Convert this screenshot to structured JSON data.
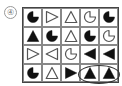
{
  "label": "④",
  "colors": {
    "fill": "#111111",
    "outline": "#555555",
    "grid": "#888888"
  },
  "grid": {
    "rows": [
      [
        {
          "shape": "pacman",
          "fill": "black"
        },
        {
          "shape": "triangle-right",
          "fill": "white"
        },
        {
          "shape": "triangle-up",
          "fill": "white"
        },
        {
          "shape": "pacman",
          "fill": "white"
        },
        {
          "shape": "pacman",
          "fill": "black"
        }
      ],
      [
        {
          "shape": "triangle-up",
          "fill": "black"
        },
        {
          "shape": "pacman",
          "fill": "black"
        },
        {
          "shape": "triangle-up",
          "fill": "white"
        },
        {
          "shape": "pacman",
          "fill": "black"
        },
        {
          "shape": "pacman",
          "fill": "white"
        }
      ],
      [
        {
          "shape": "triangle-right",
          "fill": "white"
        },
        {
          "shape": "triangle-left",
          "fill": "white"
        },
        {
          "shape": "pacman",
          "fill": "white"
        },
        {
          "shape": "triangle-left",
          "fill": "black"
        },
        {
          "shape": "triangle-left",
          "fill": "black"
        }
      ],
      [
        {
          "shape": "pacman",
          "fill": "black"
        },
        {
          "shape": "triangle-up",
          "fill": "white"
        },
        {
          "shape": "triangle-right",
          "fill": "black"
        },
        {
          "shape": "triangle-up",
          "fill": "black"
        },
        {
          "shape": "triangle-up",
          "fill": "black"
        }
      ]
    ]
  },
  "highlight": {
    "row": 4,
    "columns": [
      4,
      5
    ],
    "style": "ellipse"
  }
}
